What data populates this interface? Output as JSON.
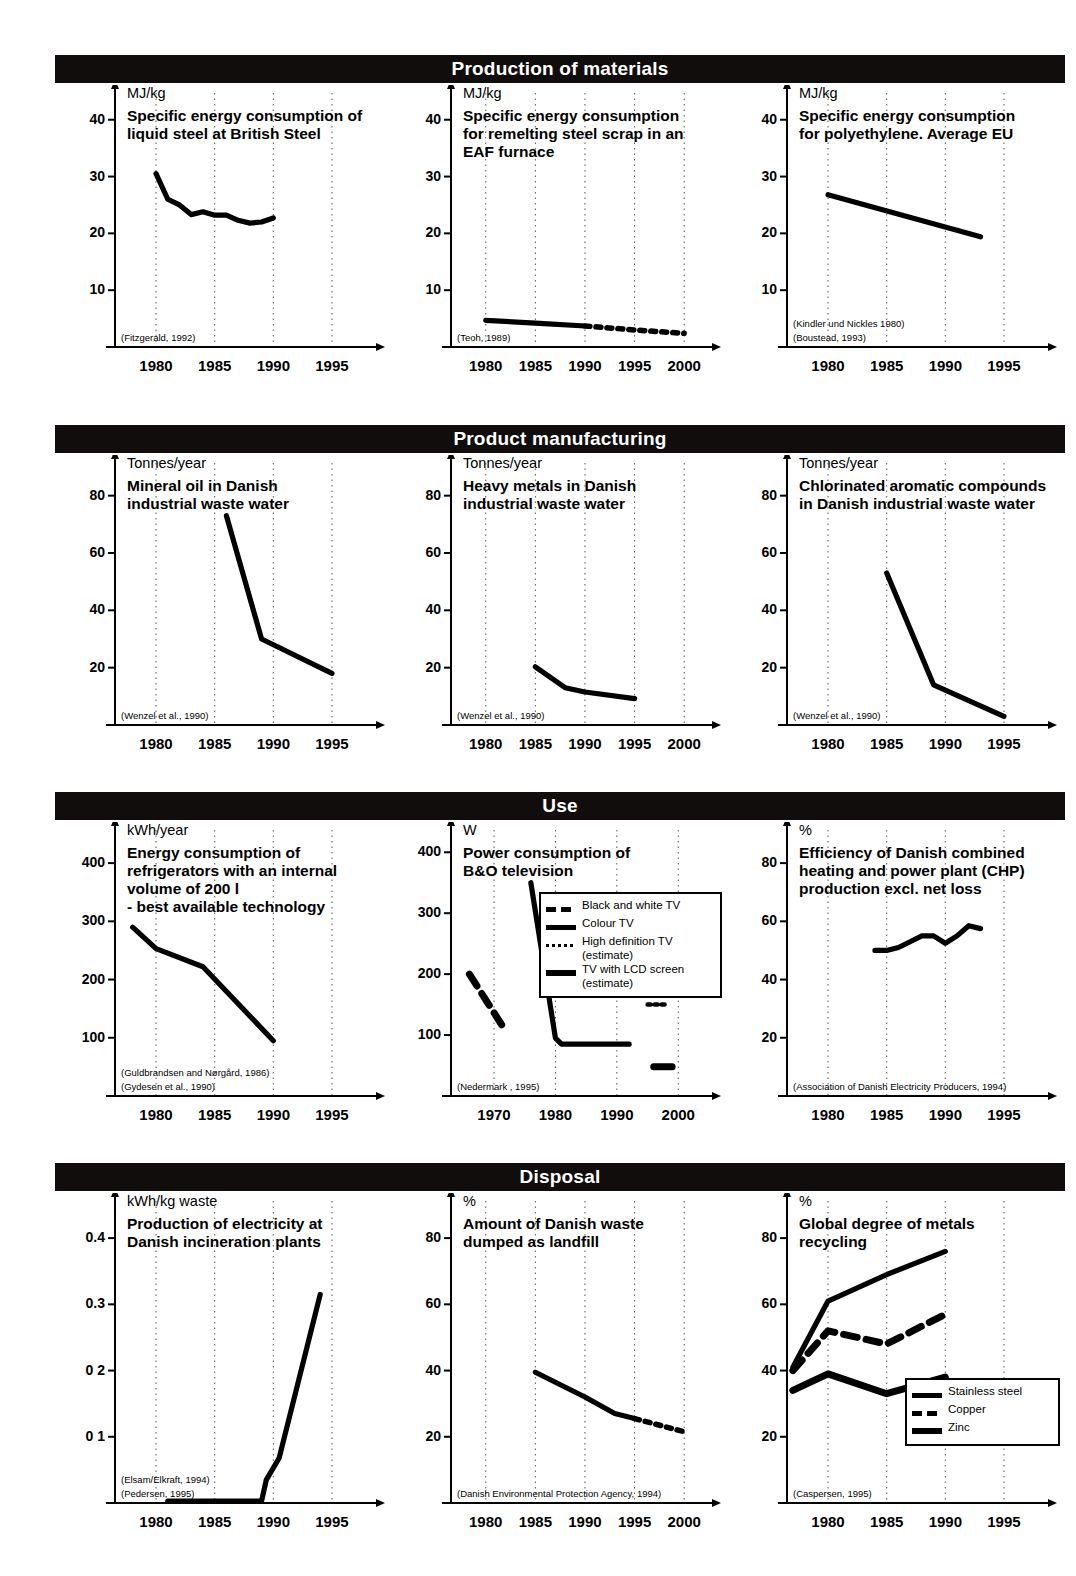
{
  "sections": [
    {
      "id": "production-of-materials",
      "label": "Production of materials"
    },
    {
      "id": "product-manufacturing",
      "label": "Product manufacturing"
    },
    {
      "id": "use",
      "label": "Use"
    },
    {
      "id": "disposal",
      "label": "Disposal"
    }
  ],
  "charts": [
    {
      "id": "specific-energy-liquid-steel",
      "unit": "MJ/kg",
      "title": "Specific energy consumption of\nliquid steel at British Steel",
      "source": "(Fitzgerald, 1992)",
      "chart_data": {
        "type": "line",
        "title": "Specific energy consumption of liquid steel at British Steel",
        "ylabel": "MJ/kg",
        "xlabel": "",
        "ylim": [
          0,
          44
        ],
        "xlim": [
          1976.5,
          1998.5
        ],
        "yticks": [
          10,
          20,
          30,
          40
        ],
        "xticks": [
          1980,
          1985,
          1990,
          1995
        ],
        "grid": "vertical-dotted",
        "legend": null,
        "series": [
          {
            "name": "Specific energy consumption",
            "style": "solid",
            "x": [
              1980,
              1981,
              1982,
              1983,
              1984,
              1985,
              1986,
              1987,
              1988,
              1989,
              1990
            ],
            "y": [
              30.5,
              26.0,
              25.0,
              23.3,
              23.8,
              23.2,
              23.2,
              22.3,
              21.8,
              22.0,
              22.7
            ]
          }
        ]
      }
    },
    {
      "id": "specific-energy-eaf-scrap",
      "unit": "MJ/kg",
      "title": "Specific energy consumption\nfor remelting steel scrap in an\nEAF furnace",
      "source": "(Teoh, 1989)",
      "chart_data": {
        "type": "line",
        "title": "Specific energy consumption for remelting steel scrap in an EAF furnace",
        "ylabel": "MJ/kg",
        "xlabel": "",
        "ylim": [
          0,
          44
        ],
        "xlim": [
          1976.5,
          2002.5
        ],
        "yticks": [
          10,
          20,
          30,
          40
        ],
        "xticks": [
          1980,
          1985,
          1990,
          1995,
          2000
        ],
        "grid": "vertical-dotted",
        "legend": null,
        "series": [
          {
            "name": "Measured",
            "style": "solid",
            "x": [
              1980,
              1985,
              1990
            ],
            "y": [
              4.7,
              4.2,
              3.7
            ]
          },
          {
            "name": "Projection",
            "style": "dotted",
            "x": [
              1990,
              1995,
              2000
            ],
            "y": [
              3.7,
              3.0,
              2.4
            ]
          }
        ]
      }
    },
    {
      "id": "specific-energy-polyethylene",
      "unit": "MJ/kg",
      "title": "Specific energy consumption\nfor polyethylene. Average EU",
      "source": "(Kindler und Nickles 1980)\n(Boustead, 1993)",
      "chart_data": {
        "type": "line",
        "title": "Specific energy consumption for polyethylene. Average EU",
        "ylabel": "MJ/kg",
        "xlabel": "",
        "ylim": [
          0,
          44
        ],
        "xlim": [
          1976.5,
          1998.5
        ],
        "yticks": [
          10,
          20,
          30,
          40
        ],
        "xticks": [
          1980,
          1985,
          1990,
          1995
        ],
        "grid": "vertical-dotted",
        "legend": null,
        "series": [
          {
            "name": "Polyethylene energy",
            "style": "solid",
            "x": [
              1980,
              1993
            ],
            "y": [
              26.8,
              19.4
            ]
          }
        ]
      }
    },
    {
      "id": "mineral-oil-waste-water",
      "unit": "Tonnes/year",
      "title": "Mineral oil in Danish\nindustrial waste water",
      "source": "(Wenzel et al., 1990)",
      "chart_data": {
        "type": "line",
        "title": "Mineral oil in Danish industrial waste water",
        "ylabel": "Tonnes/year",
        "xlabel": "",
        "ylim": [
          0,
          90
        ],
        "xlim": [
          1976.5,
          1998.5
        ],
        "yticks": [
          20,
          40,
          60,
          80
        ],
        "xticks": [
          1980,
          1985,
          1990,
          1995
        ],
        "grid": "vertical-dotted",
        "legend": null,
        "series": [
          {
            "name": "Mineral oil",
            "style": "solid",
            "x": [
              1986,
              1989,
              1995
            ],
            "y": [
              73,
              30,
              18
            ]
          }
        ]
      }
    },
    {
      "id": "heavy-metals-waste-water",
      "unit": "Tonnes/year",
      "title": "Heavy metals in Danish\nindustrial waste water",
      "source": "(Wenzel et al., 1990)",
      "chart_data": {
        "type": "line",
        "title": "Heavy metals in Danish industrial waste water",
        "ylabel": "Tonnes/year",
        "xlabel": "",
        "ylim": [
          0,
          90
        ],
        "xlim": [
          1976.5,
          2002.5
        ],
        "yticks": [
          20,
          40,
          60,
          80
        ],
        "xticks": [
          1980,
          1985,
          1990,
          1995,
          2000
        ],
        "grid": "vertical-dotted",
        "legend": null,
        "series": [
          {
            "name": "Heavy metals",
            "style": "solid",
            "x": [
              1985,
              1988,
              1990,
              1995
            ],
            "y": [
              20.3,
              13.0,
              11.5,
              9.2
            ]
          }
        ]
      }
    },
    {
      "id": "chlorinated-aromatics-waste-water",
      "unit": "Tonnes/year",
      "title": "Chlorinated aromatic compounds\nin Danish industrial waste water",
      "source": "(Wenzel et al., 1990)",
      "chart_data": {
        "type": "line",
        "title": "Chlorinated aromatic compounds in Danish industrial waste water",
        "ylabel": "Tonnes/year",
        "xlabel": "",
        "ylim": [
          0,
          90
        ],
        "xlim": [
          1976.5,
          1998.5
        ],
        "yticks": [
          20,
          40,
          60,
          80
        ],
        "xticks": [
          1980,
          1985,
          1990,
          1995
        ],
        "grid": "vertical-dotted",
        "legend": null,
        "series": [
          {
            "name": "Chlorinated aromatic compounds",
            "style": "solid",
            "x": [
              1985,
              1989,
              1995
            ],
            "y": [
              53,
              14,
              3
            ]
          }
        ]
      }
    },
    {
      "id": "refrigerator-energy-consumption",
      "unit": "kWh/year",
      "title": "Energy consumption of\nrefrigerators with an internal\nvolume of 200 l\n- best available technology",
      "source": "(Guldbrandsen and Nørgård, 1986)\n(Gydesen et al., 1990)",
      "chart_data": {
        "type": "line",
        "title": "Energy consumption of refrigerators with an internal volume of 200 l - best available technology",
        "ylabel": "kWh/year",
        "xlabel": "",
        "ylim": [
          0,
          450
        ],
        "xlim": [
          1976.5,
          1998.5
        ],
        "yticks": [
          100,
          200,
          300,
          400
        ],
        "xticks": [
          1980,
          1985,
          1990,
          1995
        ],
        "grid": "vertical-dotted",
        "legend": null,
        "series": [
          {
            "name": "Refrigerator energy",
            "style": "solid",
            "x": [
              1978,
              1980,
              1984,
              1990
            ],
            "y": [
              290,
              253,
              222,
              95
            ]
          }
        ]
      }
    },
    {
      "id": "bo-television-power",
      "unit": "W",
      "title": "Power consumption of\nB&O television",
      "source": "(Nedermark , 1995)",
      "legend": {
        "items": [
          {
            "label": "Black and white TV",
            "key": "dash"
          },
          {
            "label": "Colour TV",
            "key": "solid"
          },
          {
            "label": "High definition TV\n(estimate)",
            "key": "dot"
          },
          {
            "label": "TV with LCD screen\n(estimate)",
            "key": "thick"
          }
        ]
      },
      "chart_data": {
        "type": "line",
        "title": "Power consumption of B&O television",
        "ylabel": "W",
        "xlabel": "",
        "ylim": [
          0,
          430
        ],
        "xlim": [
          1963,
          2005
        ],
        "yticks": [
          100,
          200,
          300,
          400
        ],
        "xticks": [
          1970,
          1980,
          1990,
          2000
        ],
        "grid": "vertical-dotted",
        "legend": [
          "Black and white TV",
          "Colour TV",
          "High definition TV (estimate)",
          "TV with LCD screen (estimate)"
        ],
        "series": [
          {
            "name": "Black and white TV",
            "style": "dash",
            "x": [
              1966,
              1972
            ],
            "y": [
              200,
              105
            ]
          },
          {
            "name": "Colour TV",
            "style": "solid",
            "x": [
              1976,
              1980,
              1981,
              1992
            ],
            "y": [
              350,
              95,
              85,
              85
            ]
          },
          {
            "name": "High definition TV (estimate)",
            "style": "dot",
            "x": [
              1995,
              1998
            ],
            "y": [
              150,
              150
            ]
          },
          {
            "name": "TV with LCD screen (estimate)",
            "style": "thick",
            "x": [
              1996,
              1999
            ],
            "y": [
              48,
              48
            ]
          }
        ]
      }
    },
    {
      "id": "chp-efficiency",
      "unit": "%",
      "title": "Efficiency of Danish combined\nheating and power plant (CHP)\nproduction excl. net loss",
      "source": "(Association of Danish Electricity Producers, 1994)",
      "chart_data": {
        "type": "line",
        "title": "Efficiency of Danish combined heating and power plant (CHP) production excl. net loss",
        "ylabel": "%",
        "xlabel": "",
        "ylim": [
          0,
          90
        ],
        "xlim": [
          1976.5,
          1998.5
        ],
        "yticks": [
          20,
          40,
          60,
          80
        ],
        "xticks": [
          1980,
          1985,
          1990,
          1995
        ],
        "grid": "vertical-dotted",
        "legend": null,
        "series": [
          {
            "name": "CHP efficiency",
            "style": "solid",
            "x": [
              1984,
              1985,
              1986,
              1987,
              1988,
              1989,
              1990,
              1991,
              1992,
              1993
            ],
            "y": [
              50,
              50,
              51,
              53,
              55,
              55,
              52.5,
              55,
              58.5,
              57.5
            ]
          }
        ]
      }
    },
    {
      "id": "electricity-from-incineration",
      "unit": "kWh/kg waste",
      "title": "Production of electricity at\nDanish incineration plants",
      "source": "(Elsam/Elkraft, 1994)\n(Pedersen, 1995)",
      "chart_data": {
        "type": "line",
        "title": "Production of electricity at Danish incineration plants",
        "ylabel": "kWh/kg waste",
        "xlabel": "",
        "ylim": [
          0,
          0.45
        ],
        "xlim": [
          1976.5,
          1998.5
        ],
        "yticks": [
          0.1,
          0.2,
          0.3,
          0.4
        ],
        "ytick_labels": [
          "0 1",
          "0 2",
          "0.3",
          "0.4"
        ],
        "xticks": [
          1980,
          1985,
          1990,
          1995
        ],
        "grid": "vertical-dotted",
        "legend": null,
        "series": [
          {
            "name": "Electricity production",
            "style": "solid",
            "x": [
              1981,
              1989,
              1989.4,
              1990.5,
              1994
            ],
            "y": [
              0.003,
              0.003,
              0.035,
              0.068,
              0.315
            ]
          }
        ]
      }
    },
    {
      "id": "waste-dumped-landfill",
      "unit": "%",
      "title": "Amount of Danish waste\ndumped as landfill",
      "source": "(Danish Environmental Protection Agency, 1994)",
      "chart_data": {
        "type": "line",
        "title": "Amount of Danish waste dumped as landfill",
        "ylabel": "%",
        "xlabel": "",
        "ylim": [
          0,
          90
        ],
        "xlim": [
          1976.5,
          2002.5
        ],
        "yticks": [
          20,
          40,
          60,
          80
        ],
        "xticks": [
          1980,
          1985,
          1990,
          1995,
          2000
        ],
        "grid": "vertical-dotted",
        "legend": null,
        "series": [
          {
            "name": "Landfill measured",
            "style": "solid",
            "x": [
              1985,
              1990,
              1993,
              1995
            ],
            "y": [
              39.5,
              32,
              27,
              25.5
            ]
          },
          {
            "name": "Landfill projection",
            "style": "dotted",
            "x": [
              1995,
              2000
            ],
            "y": [
              25.5,
              21.5
            ]
          }
        ]
      }
    },
    {
      "id": "global-metals-recycling",
      "unit": "%",
      "title": "Global degree of metals\nrecycling",
      "source": "(Caspersen, 1995)",
      "legend": {
        "items": [
          {
            "label": "Stainless steel",
            "key": "solid"
          },
          {
            "label": "Copper",
            "key": "dash"
          },
          {
            "label": "Zinc",
            "key": "thick"
          }
        ]
      },
      "chart_data": {
        "type": "line",
        "title": "Global degree of metals recycling",
        "ylabel": "%",
        "xlabel": "",
        "ylim": [
          0,
          90
        ],
        "xlim": [
          1976.5,
          1998.5
        ],
        "yticks": [
          20,
          40,
          60,
          80
        ],
        "xticks": [
          1980,
          1985,
          1990,
          1995
        ],
        "grid": "vertical-dotted",
        "legend": [
          "Stainless steel",
          "Copper",
          "Zinc"
        ],
        "series": [
          {
            "name": "Stainless steel",
            "style": "solid",
            "x": [
              1977,
              1980,
              1985,
              1990
            ],
            "y": [
              41,
              61,
              69,
              76
            ]
          },
          {
            "name": "Copper",
            "style": "dash",
            "x": [
              1977,
              1980,
              1985,
              1990
            ],
            "y": [
              40,
              52,
              48,
              57
            ]
          },
          {
            "name": "Zinc",
            "style": "thick",
            "x": [
              1977,
              1980,
              1985,
              1990
            ],
            "y": [
              34,
              39,
              33,
              38
            ]
          }
        ]
      }
    }
  ]
}
